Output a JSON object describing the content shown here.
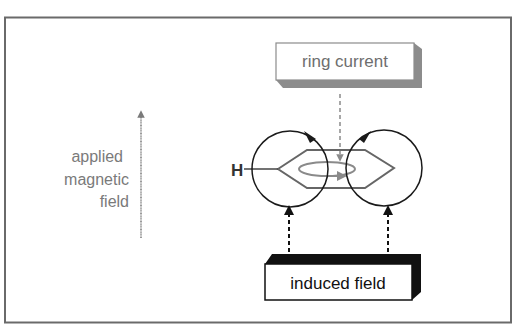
{
  "diagram": {
    "labels": {
      "applied_field_line1": "applied",
      "applied_field_line2": "magnetic",
      "applied_field_line3": "field",
      "ring_current": "ring current",
      "induced_field": "induced field",
      "hydrogen": "H"
    },
    "colors": {
      "frame": "#6a6a6a",
      "applied_arrow": "#7a7a7a",
      "ring_current_box_shadow": "#8c8c8c",
      "induced_box_shadow": "#111111",
      "circle_stroke": "#1a1a1a",
      "hexagon_stroke": "#666666",
      "ring_ellipse": "#8a8a8a"
    }
  }
}
